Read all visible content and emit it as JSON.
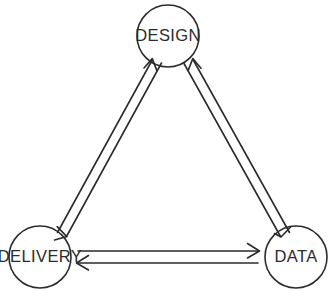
{
  "diagram": {
    "type": "cycle-triangle",
    "title": "",
    "background_color": "#ffffff",
    "stroke_color": "#2b2b2b",
    "nodes": [
      {
        "id": "design",
        "label": "DESIGN",
        "shape": "circle",
        "cx": 168,
        "cy": 36,
        "r": 31,
        "position": "top"
      },
      {
        "id": "delivery",
        "label": "DELIVERY",
        "shape": "circle",
        "cx": 40,
        "cy": 257,
        "r": 31,
        "position": "bottom-left"
      },
      {
        "id": "data",
        "label": "DATA",
        "shape": "circle",
        "cx": 296,
        "cy": 257,
        "r": 31,
        "position": "bottom-right"
      }
    ],
    "edges": [
      {
        "id": "delivery-design",
        "from": "delivery",
        "to": "design",
        "direction": "bidirectional",
        "style": "double-line",
        "side": "left"
      },
      {
        "id": "design-data",
        "from": "design",
        "to": "data",
        "direction": "bidirectional",
        "style": "double-line",
        "side": "right"
      },
      {
        "id": "delivery-data",
        "from": "delivery",
        "to": "data",
        "direction": "bidirectional",
        "style": "double-line",
        "side": "bottom"
      }
    ]
  }
}
